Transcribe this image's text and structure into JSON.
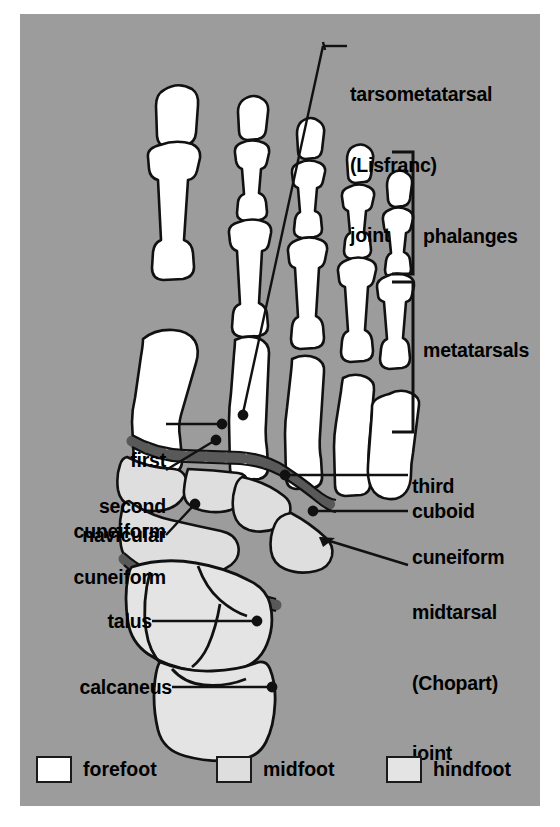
{
  "figure": {
    "background_color": "#9c9c9c",
    "outline_color": "#111111",
    "joint_band_color": "#595959"
  },
  "labels": {
    "tarsometatarsal": {
      "line1": "tarsometatarsal",
      "line2": "(Lisfranc)",
      "line3": "joint"
    },
    "phalanges": "phalanges",
    "metatarsals": "metatarsals",
    "first_cuneiform": {
      "line1": "first",
      "line2": "cuneiform"
    },
    "second_cuneiform": {
      "line1": "second",
      "line2": "cuneiform"
    },
    "navicular": "navicular",
    "third_cuneiform": {
      "line1": "third",
      "line2": "cuneiform"
    },
    "cuboid": "cuboid",
    "midtarsal": {
      "line1": "midtarsal",
      "line2": "(Chopart)",
      "line3": "joint"
    },
    "talus": "talus",
    "calcaneus": "calcaneus"
  },
  "legend": {
    "items": [
      {
        "label": "forefoot",
        "color": "#ffffff"
      },
      {
        "label": "midfoot",
        "color": "#dedede"
      },
      {
        "label": "hindfoot",
        "color": "#e4e4e4"
      }
    ]
  },
  "regions": {
    "forefoot_fill": "#ffffff",
    "midfoot_fill": "#dedede",
    "hindfoot_fill": "#e4e4e4"
  }
}
